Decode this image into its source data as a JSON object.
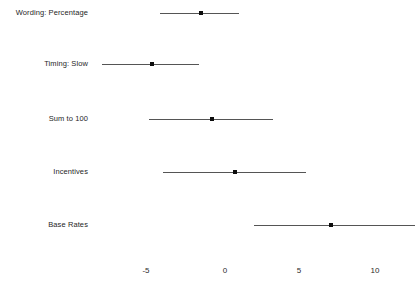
{
  "chart_data": {
    "type": "scatter",
    "subtype": "forest-plot",
    "title": "",
    "xlabel": "",
    "ylabel": "",
    "xlim": [
      -8.6,
      12.6
    ],
    "ylim": [
      0,
      6
    ],
    "grid": false,
    "legend": null,
    "axis": {
      "ticks": [
        -5,
        0,
        5,
        10
      ],
      "tick_labels": [
        "-5",
        "0",
        "5",
        "10"
      ],
      "tick_pixel_x": [
        146,
        225,
        299,
        375
      ],
      "orientation": "bottom"
    },
    "categories": [
      "Wording: Percentage",
      "Timing: Slow",
      "Sum to 100",
      "Incentives",
      "Base Rates"
    ],
    "points": [
      {
        "label": "Wording: Percentage",
        "estimate": -1.4,
        "ci_low": -4.1,
        "ci_high": 1.1,
        "row_y": 13
      },
      {
        "label": "Timing: Slow",
        "estimate": -4.6,
        "ci_low": -7.9,
        "ci_high": -1.5,
        "row_y": 64
      },
      {
        "label": "Sum to 100",
        "estimate": -0.65,
        "ci_low": -4.8,
        "ci_high": 3.3,
        "row_y": 119
      },
      {
        "label": "Incentives",
        "estimate": 0.8,
        "ci_low": -3.9,
        "ci_high": 5.5,
        "row_y": 172
      },
      {
        "label": "Base Rates",
        "estimate": 7.1,
        "ci_low": 2.1,
        "ci_high": 12.6,
        "row_y": 225
      }
    ],
    "colors": {
      "point": "#0d0d0d",
      "interval": "#555555",
      "text": "#262626",
      "background": "#ffffff"
    }
  }
}
